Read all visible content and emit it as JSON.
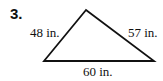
{
  "problem": {
    "number": "3."
  },
  "triangle": {
    "sides": [
      {
        "name": "left",
        "label": "48 in."
      },
      {
        "name": "right",
        "label": "57 in."
      },
      {
        "name": "bottom",
        "label": "60 in."
      }
    ]
  }
}
